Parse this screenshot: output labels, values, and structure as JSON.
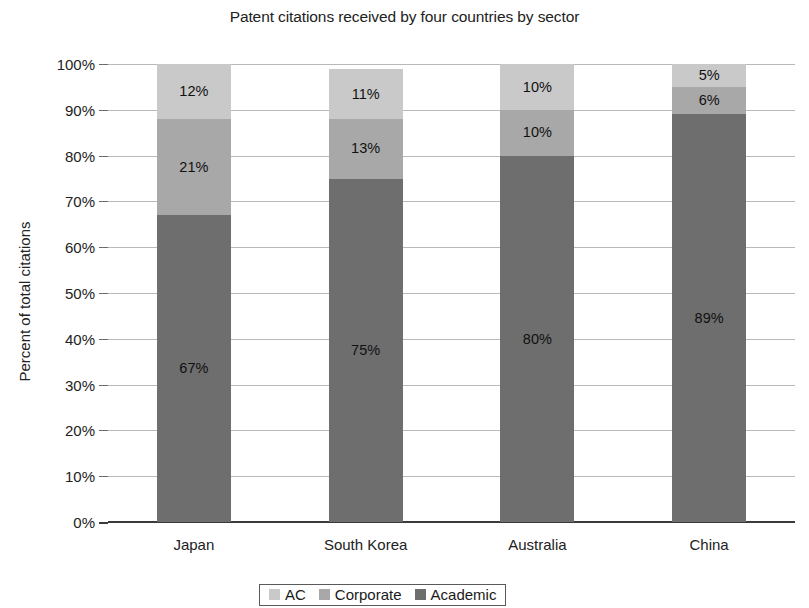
{
  "chart_data": {
    "type": "bar",
    "variant": "stacked-100-percent",
    "title": "Patent citations received by four countries by sector",
    "xlabel": "",
    "ylabel": "Percent of total citations",
    "ylim": [
      0,
      100
    ],
    "ytick_labels": [
      "0%",
      "10%",
      "20%",
      "30%",
      "40%",
      "50%",
      "60%",
      "70%",
      "80%",
      "90%",
      "100%"
    ],
    "ytick_values": [
      0,
      10,
      20,
      30,
      40,
      50,
      60,
      70,
      80,
      90,
      100
    ],
    "grid": true,
    "legend_position": "bottom",
    "categories": [
      "Japan",
      "South Korea",
      "Australia",
      "China"
    ],
    "series": [
      {
        "name": "Academic",
        "color": "#6e6e6e",
        "values": [
          67,
          75,
          80,
          89
        ],
        "labels": [
          "67%",
          "75%",
          "80%",
          "89%"
        ]
      },
      {
        "name": "Corporate",
        "color": "#a8a8a8",
        "values": [
          21,
          13,
          10,
          6
        ],
        "labels": [
          "21%",
          "13%",
          "10%",
          "6%"
        ]
      },
      {
        "name": "AC",
        "color": "#c9c9c9",
        "values": [
          12,
          11,
          10,
          5
        ],
        "labels": [
          "12%",
          "11%",
          "10%",
          "5%"
        ]
      }
    ],
    "legend": [
      {
        "label": "AC",
        "color": "#c9c9c9"
      },
      {
        "label": "Corporate",
        "color": "#a8a8a8"
      },
      {
        "label": "Academic",
        "color": "#6e6e6e"
      }
    ]
  }
}
